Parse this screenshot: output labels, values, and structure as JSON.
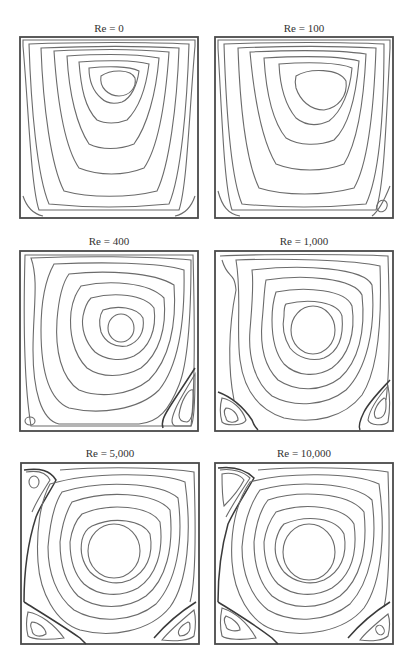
{
  "figure": {
    "line_color": "#6b6b6b",
    "frame_color": "#4a4a4a",
    "background": "#ffffff"
  },
  "panels": [
    {
      "id": "re0",
      "title": "Re = 0",
      "re": 0,
      "secondary_vortices": [
        "bottom-left (tiny)",
        "bottom-right (tiny)"
      ]
    },
    {
      "id": "re100",
      "title": "Re = 100",
      "re": 100,
      "secondary_vortices": [
        "bottom-right (small)"
      ]
    },
    {
      "id": "re400",
      "title": "Re = 400",
      "re": 400,
      "secondary_vortices": [
        "bottom-left (small)",
        "bottom-right (large)"
      ]
    },
    {
      "id": "re1000",
      "title": "Re = 1,000",
      "re": 1000,
      "secondary_vortices": [
        "bottom-left",
        "bottom-right"
      ]
    },
    {
      "id": "re5000",
      "title": "Re = 5,000",
      "re": 5000,
      "secondary_vortices": [
        "top-left",
        "bottom-left",
        "bottom-right"
      ]
    },
    {
      "id": "re10000",
      "title": "Re = 10,000",
      "re": 10000,
      "secondary_vortices": [
        "top-left",
        "bottom-left",
        "bottom-right"
      ]
    }
  ]
}
